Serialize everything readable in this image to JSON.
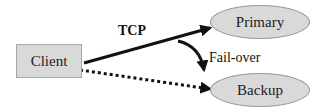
{
  "diagram": {
    "nodes": {
      "client": {
        "label": "Client",
        "shape": "rectangle"
      },
      "primary": {
        "label": "Primary",
        "shape": "ellipse"
      },
      "backup": {
        "label": "Backup",
        "shape": "ellipse"
      }
    },
    "edges": {
      "tcp": {
        "label": "TCP",
        "from": "Client",
        "to": "Primary",
        "style": "solid"
      },
      "failover": {
        "label": "Fail-over",
        "from": "Primary",
        "to": "Backup",
        "style": "solid-curved"
      },
      "backup_link": {
        "label": "",
        "from": "Client",
        "to": "Backup",
        "style": "dotted"
      }
    },
    "colors": {
      "node_fill": "#d9d9d9",
      "node_border": "#9a9a9a",
      "edge": "#111111"
    }
  }
}
